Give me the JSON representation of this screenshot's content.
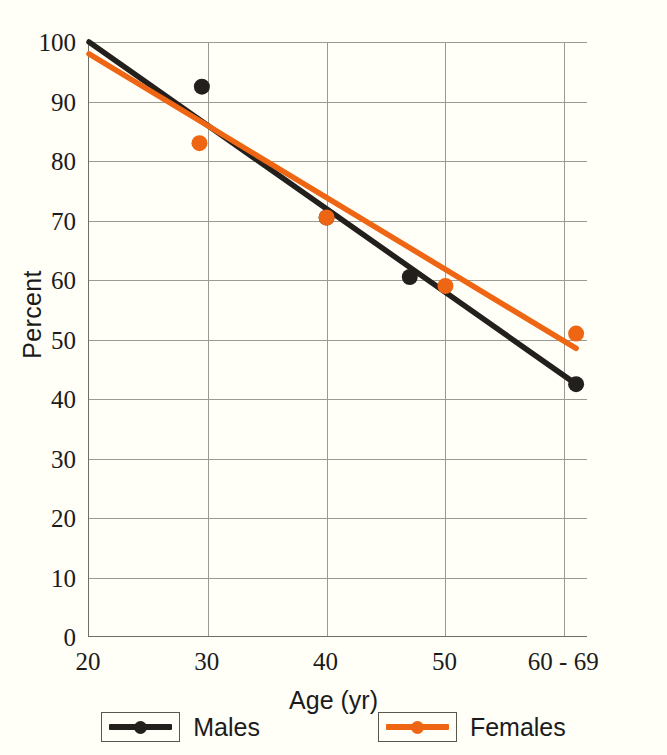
{
  "background_color": "#fffef7",
  "axes": {
    "y_title": "Percent",
    "x_title": "Age (yr)",
    "y_ticks": [
      "0",
      "10",
      "20",
      "30",
      "40",
      "50",
      "60",
      "70",
      "80",
      "90",
      "100"
    ],
    "x_ticks": [
      "20",
      "30",
      "40",
      "50",
      "60 - 69"
    ]
  },
  "legend": {
    "items": [
      {
        "label": "Males",
        "color": "#231f1c"
      },
      {
        "label": "Females",
        "color": "#ee6613"
      }
    ]
  },
  "chart_data": {
    "type": "scatter",
    "title": "",
    "xlabel": "Age (yr)",
    "ylabel": "Percent",
    "xlim": [
      20,
      62
    ],
    "ylim": [
      0,
      100
    ],
    "x_tick_values": [
      20,
      30,
      40,
      50,
      60
    ],
    "x_tick_labels": [
      "20",
      "30",
      "40",
      "50",
      "60 - 69"
    ],
    "y_tick_values": [
      0,
      10,
      20,
      30,
      40,
      50,
      60,
      70,
      80,
      90,
      100
    ],
    "grid": true,
    "legend_position": "bottom",
    "series": [
      {
        "name": "Males",
        "color": "#231f1c",
        "marker": "circle",
        "points": [
          {
            "x": 29.5,
            "y": 92.5
          },
          {
            "x": 40.0,
            "y": 70.5
          },
          {
            "x": 47.0,
            "y": 60.5
          },
          {
            "x": 61.0,
            "y": 42.5
          }
        ],
        "trendline": {
          "x0": 20,
          "y0": 100,
          "x1": 61,
          "y1": 42.5
        }
      },
      {
        "name": "Females",
        "color": "#ee6613",
        "marker": "circle",
        "points": [
          {
            "x": 29.3,
            "y": 83.0
          },
          {
            "x": 40.0,
            "y": 70.5
          },
          {
            "x": 50.0,
            "y": 59.0
          },
          {
            "x": 61.0,
            "y": 51.0
          }
        ],
        "trendline": {
          "x0": 20,
          "y0": 98,
          "x1": 61,
          "y1": 48.5
        }
      }
    ]
  }
}
